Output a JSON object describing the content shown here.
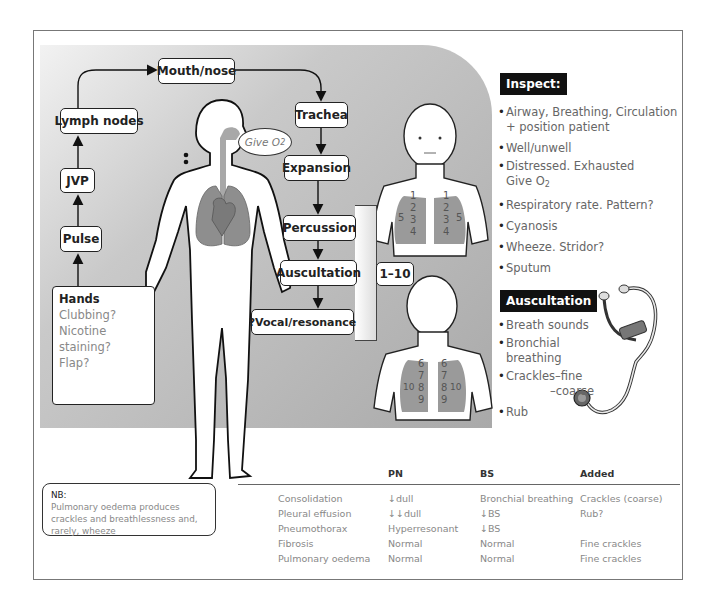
{
  "flow": {
    "mouth_nose": "Mouth/nose",
    "lymph_nodes": "Lymph nodes",
    "jvp": "JVP",
    "pulse": "Pulse",
    "trachea": "Trachea",
    "expansion": "Expansion",
    "percussion": "Percussion",
    "auscultation": "Auscultation",
    "vocal_resonance": "?Vocal/resonance",
    "zones": "1–10"
  },
  "hands": {
    "title": "Hands",
    "items": [
      "Clubbing?",
      "Nicotine staining?",
      "Flap?"
    ]
  },
  "speech_bubble": {
    "text": "Give O",
    "subscript": "2"
  },
  "front_chest_numbers": {
    "left": [
      "1",
      "2",
      "3",
      "4",
      "5"
    ],
    "right": [
      "1",
      "2",
      "3",
      "4",
      "5"
    ]
  },
  "back_chest_numbers": {
    "left": [
      "6",
      "7",
      "8",
      "9",
      "10"
    ],
    "right": [
      "6",
      "7",
      "8",
      "9",
      "10"
    ]
  },
  "inspect": {
    "title": "Inspect:",
    "items": [
      {
        "line1": "Airway, Breathing, Circulation",
        "line2": "+ position patient"
      },
      {
        "line1": "Well/unwell"
      },
      {
        "line1": "Distressed. Exhausted",
        "line2": "Give O",
        "line2_sub": "2"
      },
      {
        "line1": "Respiratory rate. Pattern?"
      },
      {
        "line1": "Cyanosis"
      },
      {
        "line1": "Wheeze. Stridor?"
      },
      {
        "line1": "Sputum"
      }
    ]
  },
  "auscultation_panel": {
    "title": "Auscultation",
    "items": [
      {
        "line1": "Breath sounds"
      },
      {
        "line1": "Bronchial breathing"
      },
      {
        "line1": "Crackles–fine",
        "line2": "–coarse"
      },
      {
        "line1": "Rub"
      }
    ]
  },
  "nb": {
    "title": "NB:",
    "text": "Pulmonary oedema produces crackles and breathlessness and, rarely, wheeze"
  },
  "table": {
    "headers": [
      "",
      "PN",
      "BS",
      "Added"
    ],
    "rows": [
      [
        "Consolidation",
        "↓dull",
        "Bronchial breathing",
        "Crackles (coarse)"
      ],
      [
        "Pleural effusion",
        "↓↓dull",
        "↓BS",
        "Rub?"
      ],
      [
        "Pneumothorax",
        "Hyperresonant",
        "↓BS",
        ""
      ],
      [
        "Fibrosis",
        "Normal",
        "Normal",
        "Fine crackles"
      ],
      [
        "Pulmonary oedema",
        "Normal",
        "Normal",
        "Fine crackles"
      ]
    ]
  },
  "colors": {
    "lung_gray": "#8e8e8e",
    "box_border": "#222222",
    "header_bg": "#111111"
  }
}
